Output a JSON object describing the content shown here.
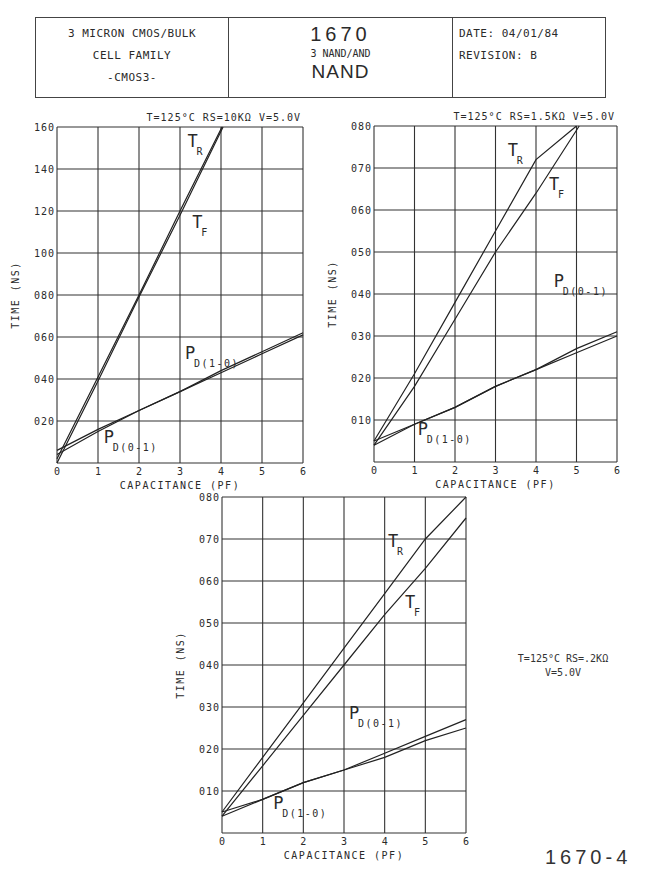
{
  "header": {
    "left": [
      "3 MICRON CMOS/BULK",
      "CELL FAMILY",
      "-CMOS3-"
    ],
    "center": {
      "cell_number": "1670",
      "description": "3 NAND/AND",
      "type": "NAND"
    },
    "right": {
      "date": "DATE: 04/01/84",
      "revision": "REVISION: B"
    }
  },
  "footer": {
    "figure_id": "1670-4"
  },
  "side_condition": {
    "line1": "T=125°C  RS=.2KΩ",
    "line2": "V=5.0V"
  },
  "chart_data": [
    {
      "type": "line",
      "title": "T=125°C RS=10KΩ V=5.0V",
      "xlabel": "CAPACITANCE (PF)",
      "ylabel": "TIME (NS)",
      "xlim": [
        0,
        6
      ],
      "ylim": [
        0,
        160
      ],
      "xticks": [
        "0",
        "1",
        "2",
        "3",
        "4",
        "5",
        "6"
      ],
      "yticks": [
        "020",
        "040",
        "060",
        "080",
        "100",
        "120",
        "140",
        "160"
      ],
      "grid": true,
      "x": [
        0,
        1,
        2,
        3,
        4,
        5,
        6
      ],
      "series": [
        {
          "name": "TR",
          "values": [
            2,
            41,
            80,
            120,
            159,
            null,
            null
          ]
        },
        {
          "name": "TF",
          "values": [
            0,
            39,
            79,
            118,
            158,
            null,
            null
          ]
        },
        {
          "name": "PD(1-0)",
          "values": [
            4,
            15,
            25,
            34,
            44,
            53,
            62
          ]
        },
        {
          "name": "PD(0-1)",
          "values": [
            6,
            16,
            25,
            34,
            43,
            52,
            61
          ]
        }
      ]
    },
    {
      "type": "line",
      "title": "T=125°C RS=1.5KΩ V=5.0V",
      "xlabel": "CAPACITANCE (PF)",
      "ylabel": "TIME (NS)",
      "xlim": [
        0,
        6
      ],
      "ylim": [
        0,
        80
      ],
      "xticks": [
        "0",
        "1",
        "2",
        "3",
        "4",
        "5",
        "6"
      ],
      "yticks": [
        "010",
        "020",
        "030",
        "040",
        "050",
        "060",
        "070",
        "080"
      ],
      "grid": true,
      "x": [
        0,
        1,
        2,
        3,
        4,
        5,
        6
      ],
      "series": [
        {
          "name": "TR",
          "values": [
            5,
            21,
            38,
            55,
            72,
            89,
            null
          ]
        },
        {
          "name": "TF",
          "values": [
            4,
            18,
            34,
            50,
            64,
            79,
            null
          ]
        },
        {
          "name": "PD(0-1)",
          "values": [
            4,
            9,
            13,
            18,
            22,
            27,
            31
          ]
        },
        {
          "name": "PD(1-0)",
          "values": [
            5,
            9,
            13,
            18,
            22,
            26,
            30
          ]
        }
      ]
    },
    {
      "type": "line",
      "title": "T=125°C RS=.2KΩ V=5.0V",
      "xlabel": "CAPACITANCE (PF)",
      "ylabel": "TIME (NS)",
      "xlim": [
        0,
        6
      ],
      "ylim": [
        0,
        80
      ],
      "xticks": [
        "0",
        "1",
        "2",
        "3",
        "4",
        "5",
        "6"
      ],
      "yticks": [
        "010",
        "020",
        "030",
        "040",
        "050",
        "060",
        "070",
        "080"
      ],
      "grid": true,
      "x": [
        0,
        1,
        2,
        3,
        4,
        5,
        6
      ],
      "series": [
        {
          "name": "TR",
          "values": [
            5,
            18,
            31,
            44,
            57,
            70,
            80
          ]
        },
        {
          "name": "TF",
          "values": [
            4,
            16,
            28,
            40,
            52,
            63,
            75
          ]
        },
        {
          "name": "PD(0-1)",
          "values": [
            4,
            8,
            12,
            15,
            19,
            23,
            27
          ]
        },
        {
          "name": "PD(1-0)",
          "values": [
            5,
            8,
            12,
            15,
            18,
            22,
            25
          ]
        }
      ]
    }
  ]
}
